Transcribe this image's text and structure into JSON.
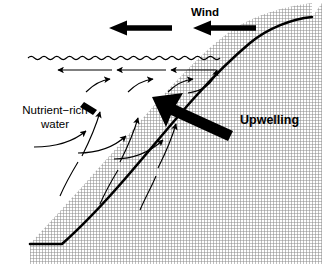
{
  "diagram": {
    "width": 322,
    "height": 264,
    "background_color": "#ffffff",
    "ink_color": "#000000",
    "labels": {
      "wind": "Wind",
      "upwelling": "Upwelling",
      "nutrient_line1": "Nutrient−rich",
      "nutrient_line2": "water"
    },
    "features": {
      "water_surface": "wavy-line",
      "slope": "hatched-continental-slope",
      "slope_fill_pattern": "crosshatch",
      "slope_fill_color": "#9a9a9a"
    },
    "arrows": {
      "wind_arrows": 2,
      "wind_direction": "left",
      "surface_current_arrows": 3,
      "surface_current_direction": "left",
      "circulation_arrows": 6,
      "circulation_direction": "up-and-right-along-slope",
      "upwelling_arrow_direction": "up-left",
      "nutrient_pointer": "leader-line"
    }
  }
}
